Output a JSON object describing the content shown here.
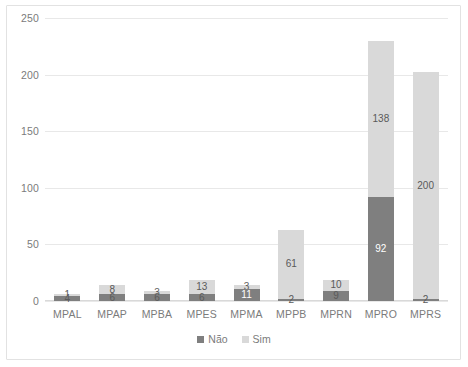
{
  "chart_data": {
    "type": "bar",
    "subtype": "stacked-column",
    "title": "",
    "subtitle": "",
    "xlabel": "",
    "ylabel": "",
    "categories": [
      "MPAL",
      "MPAP",
      "MPBA",
      "MPES",
      "MPMA",
      "MPPB",
      "MPRN",
      "MPRO",
      "MPRS"
    ],
    "series": [
      {
        "name": "Não",
        "color": "#7f7f7f",
        "values": [
          4,
          6,
          6,
          6,
          11,
          2,
          9,
          92,
          2
        ]
      },
      {
        "name": "Sim",
        "color": "#d9d9d9",
        "values": [
          1,
          8,
          3,
          13,
          3,
          61,
          10,
          138,
          200
        ]
      }
    ],
    "totals": [
      5,
      14,
      9,
      19,
      14,
      63,
      19,
      230,
      202
    ],
    "ylim": [
      0,
      250
    ],
    "yticks": [
      0,
      50,
      100,
      150,
      200,
      250
    ],
    "ytick_labels": [
      "0",
      "50",
      "100",
      "150",
      "200",
      "250"
    ],
    "grid": true,
    "grid_axis": "y",
    "legend": {
      "position": "bottom",
      "entries": [
        {
          "label": "Não",
          "color": "#7f7f7f"
        },
        {
          "label": "Sim",
          "color": "#d9d9d9"
        }
      ]
    },
    "data_labels": {
      "shown": true,
      "position": "center",
      "MPAL": {
        "nao": "4",
        "sim": "1"
      },
      "MPAP": {
        "nao": "6",
        "sim": "8"
      },
      "MPBA": {
        "nao": "6",
        "sim": "3"
      },
      "MPES": {
        "nao": "6",
        "sim": "13"
      },
      "MPMA": {
        "nao": "11",
        "sim": "3"
      },
      "MPPB": {
        "nao": "2",
        "sim": "61"
      },
      "MPRN": {
        "nao": "9",
        "sim": "10"
      },
      "MPRO": {
        "nao": "92",
        "sim": "138"
      },
      "MPRS": {
        "nao": "2",
        "sim": "200"
      }
    }
  },
  "style": {
    "plot_background": "#ffffff",
    "grid_color": "#e8e8e8",
    "border_color": "#e2e2e2",
    "tick_text_color": "#7b7b7b"
  }
}
